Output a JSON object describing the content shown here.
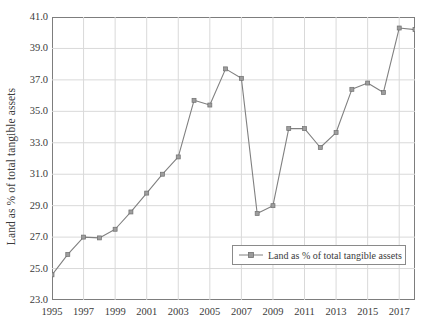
{
  "chart_data": {
    "type": "line",
    "title": "",
    "xlabel": "",
    "ylabel": "Land as % of total tangible assets",
    "xlim": [
      1995,
      2018
    ],
    "ylim": [
      23.0,
      41.0
    ],
    "grid": true,
    "legend_position": "inside-lower-right",
    "x": [
      1995,
      1996,
      1997,
      1998,
      1999,
      2000,
      2001,
      2002,
      2003,
      2004,
      2005,
      2006,
      2007,
      2008,
      2009,
      2010,
      2011,
      2012,
      2013,
      2014,
      2015,
      2016,
      2017,
      2018
    ],
    "x_tick_labels": [
      "1995",
      "1997",
      "1999",
      "2001",
      "2003",
      "2005",
      "2007",
      "2009",
      "2011",
      "2013",
      "2015",
      "2017"
    ],
    "x_tick_values": [
      1995,
      1997,
      1999,
      2001,
      2003,
      2005,
      2007,
      2009,
      2011,
      2013,
      2015,
      2017
    ],
    "y_tick_labels": [
      "41.0",
      "39.0",
      "37.0",
      "35.0",
      "33.0",
      "31.0",
      "29.0",
      "27.0",
      "25.0",
      "23.0"
    ],
    "y_tick_values": [
      41.0,
      39.0,
      37.0,
      35.0,
      33.0,
      31.0,
      29.0,
      27.0,
      25.0,
      23.0
    ],
    "series": [
      {
        "name": "Land as % of total tangible assets",
        "color": "#808080",
        "marker": "square",
        "values": [
          24.6,
          25.9,
          27.0,
          26.95,
          27.5,
          28.6,
          29.8,
          31.0,
          32.1,
          35.7,
          35.4,
          37.7,
          37.1,
          28.5,
          29.0,
          33.9,
          33.9,
          32.7,
          33.65,
          36.4,
          36.8,
          36.2,
          40.3,
          40.2
        ]
      }
    ],
    "legend": [
      {
        "label": "Land as % of total tangible assets",
        "color": "#808080"
      }
    ]
  }
}
